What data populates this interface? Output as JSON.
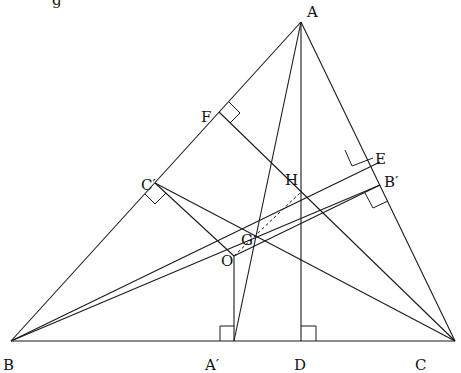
{
  "figure": {
    "clipped_top_text": "g"
  },
  "points": {
    "A": {
      "label": "A",
      "x": 301,
      "y": 22
    },
    "B": {
      "label": "B",
      "x": 11,
      "y": 341
    },
    "C": {
      "label": "C",
      "x": 455,
      "y": 341
    },
    "A_prime": {
      "label": "A′",
      "x": 234,
      "y": 341
    },
    "D": {
      "label": "D",
      "x": 301,
      "y": 341
    },
    "F": {
      "label": "F",
      "x": 219,
      "y": 112
    },
    "C_prime": {
      "label": "C′",
      "x": 155,
      "y": 183
    },
    "E": {
      "label": "E",
      "x": 380,
      "y": 162
    },
    "B_prime": {
      "label": "B′",
      "x": 380,
      "y": 185
    },
    "H": {
      "label": "H",
      "x": 301,
      "y": 192
    },
    "G": {
      "label": "G",
      "x": 255,
      "y": 238
    },
    "O": {
      "label": "O",
      "x": 234,
      "y": 256
    }
  },
  "segments": [
    {
      "name": "side-ab",
      "from": "A",
      "to": "B",
      "style": "solid"
    },
    {
      "name": "side-ac",
      "from": "A",
      "to": "C",
      "style": "solid"
    },
    {
      "name": "side-bc",
      "from": "B",
      "to": "C",
      "style": "solid"
    },
    {
      "name": "altitude-ad",
      "from": "A",
      "to": "D",
      "style": "solid"
    },
    {
      "name": "median-aa-prime",
      "from": "A",
      "to": "A_prime",
      "style": "solid"
    },
    {
      "name": "altitude-cf",
      "from": "C",
      "to": "F",
      "style": "solid"
    },
    {
      "name": "altitude-be",
      "from": "B",
      "to": "E",
      "style": "solid"
    },
    {
      "name": "median-bb-prime",
      "from": "B",
      "to": "B_prime",
      "style": "solid"
    },
    {
      "name": "median-cc-prime",
      "from": "C",
      "to": "C_prime",
      "style": "solid"
    },
    {
      "name": "perp-bisector-c-prime-o",
      "from": "C_prime",
      "to": "O",
      "style": "solid"
    },
    {
      "name": "perp-bisector-a-prime-o",
      "from": "A_prime",
      "to": "O",
      "style": "solid"
    },
    {
      "name": "perp-bisector-b-prime-o",
      "from": "B_prime",
      "to": "O",
      "style": "solid"
    },
    {
      "name": "euler-line-oh",
      "from": "O",
      "to": "H",
      "style": "dashed"
    }
  ],
  "right_angles": [
    "D",
    "A_prime",
    "F",
    "C_prime",
    "E",
    "B_prime"
  ]
}
